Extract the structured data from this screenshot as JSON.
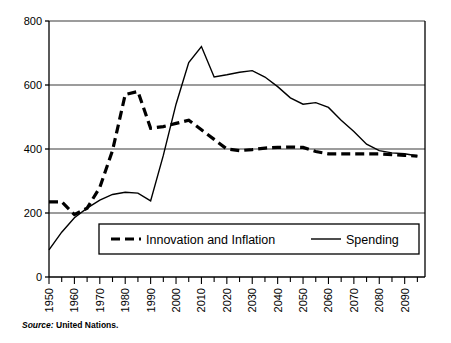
{
  "source": {
    "keyword": "Source:",
    "value": " United Nations."
  },
  "chart_data": {
    "type": "line",
    "title": "",
    "xlabel": "",
    "ylabel": "",
    "xlim": [
      1950,
      2098
    ],
    "ylim": [
      0,
      800
    ],
    "grid": true,
    "grid_axis": "y",
    "legend_position": "inside-bottom-center",
    "y_ticks": [
      0,
      200,
      400,
      600,
      800
    ],
    "y_tick_labels": [
      "0",
      "200",
      "400",
      "600",
      "800"
    ],
    "x_ticks": [
      1950,
      1960,
      1970,
      1980,
      1990,
      2000,
      2010,
      2020,
      2030,
      2040,
      2050,
      2060,
      2070,
      2080,
      2090
    ],
    "x_tick_labels": [
      "1950",
      "1960",
      "1970",
      "1980",
      "1990",
      "2000",
      "2010",
      "2020",
      "2030",
      "2040",
      "2050",
      "2060",
      "2070",
      "2080",
      "2090"
    ],
    "x_minor_tick_interval": 5,
    "x": [
      1950,
      1955,
      1960,
      1965,
      1970,
      1975,
      1980,
      1985,
      1990,
      1995,
      2000,
      2005,
      2010,
      2015,
      2020,
      2025,
      2030,
      2035,
      2040,
      2045,
      2050,
      2055,
      2060,
      2065,
      2070,
      2075,
      2080,
      2085,
      2090,
      2095
    ],
    "series": [
      {
        "name": "Innovation and Inflation",
        "style": "dashed",
        "color": "#000000",
        "line_width": 3.2,
        "values": [
          235,
          235,
          195,
          215,
          280,
          395,
          570,
          580,
          465,
          470,
          480,
          490,
          460,
          430,
          400,
          395,
          398,
          403,
          405,
          406,
          405,
          392,
          385,
          385,
          385,
          385,
          385,
          382,
          380,
          378
        ]
      },
      {
        "name": "Spending",
        "style": "solid",
        "color": "#000000",
        "line_width": 1.4,
        "values": [
          85,
          140,
          185,
          215,
          240,
          258,
          265,
          262,
          238,
          380,
          540,
          670,
          720,
          625,
          632,
          640,
          645,
          625,
          595,
          560,
          540,
          545,
          530,
          490,
          455,
          415,
          395,
          388,
          385,
          378
        ]
      }
    ],
    "legend": [
      {
        "label": "Innovation and Inflation",
        "style": "dashed"
      },
      {
        "label": "Spending",
        "style": "solid"
      }
    ]
  }
}
